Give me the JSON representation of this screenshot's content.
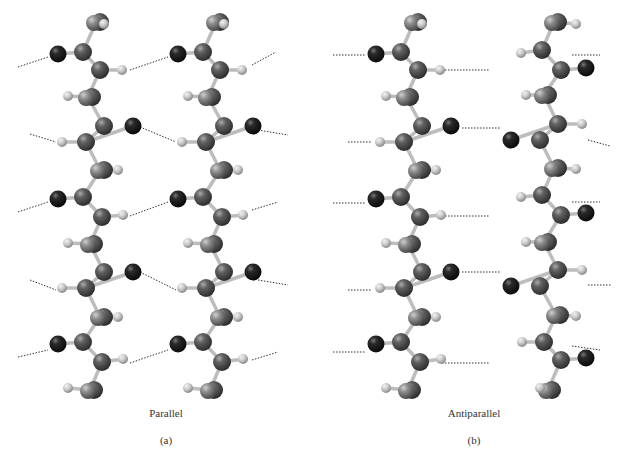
{
  "figure": {
    "panels": [
      {
        "id": "a",
        "title": "Parallel",
        "label": "(a)",
        "title_x": 166,
        "title_y": 414,
        "label_x": 166,
        "label_y": 441
      },
      {
        "id": "b",
        "title": "Antiparallel",
        "label": "(b)",
        "title_x": 474,
        "title_y": 414,
        "label_x": 474,
        "label_y": 441
      }
    ]
  },
  "colors": {
    "oxygen": "#1e1e1e",
    "carbon": "#5a5a5a",
    "nitrogen": "#4a4a4a",
    "sidechain": "#8a8a8a",
    "hydrogen": "#c8c8c8",
    "bond": "#b8b8b8",
    "hbond": "#333333"
  },
  "legend_atoms": [
    "oxygen",
    "carbon",
    "nitrogen",
    "hydrogen",
    "side-chain"
  ]
}
